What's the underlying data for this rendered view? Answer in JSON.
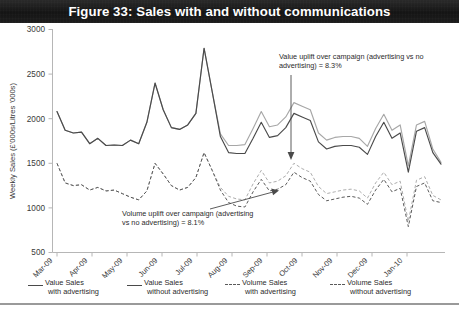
{
  "figure": {
    "title": "Figure 33: Sales with and without communications"
  },
  "axes": {
    "ylabel": "Weekly Sales (£'000s/Litres '000s)",
    "yticks": [
      "3000",
      "2500",
      "2000",
      "1500",
      "1000",
      "500"
    ],
    "xticks": [
      "Mar-09",
      "Apr-09",
      "May-09",
      "Jun-09",
      "Jul-09",
      "Aug-09",
      "Sep-09",
      "Oct-09",
      "Nov-09",
      "Dec-09",
      "Jan-10"
    ]
  },
  "annotations": [
    {
      "name": "value-uplift-annotation",
      "line1": "Value uplift over campaign (advertising vs no",
      "line2": "advertising) = 8.3%"
    },
    {
      "name": "volume-uplift-annotation",
      "line1": "Volume uplift over campaign (advertising",
      "line2": "vs no advertising) = 8.1%"
    }
  ],
  "legend": [
    {
      "line1": "Value Sales",
      "line2": "with advertising",
      "style": "solid-dark",
      "color": "#4a4a4a"
    },
    {
      "line1": "Value Sales",
      "line2": "without advertising",
      "style": "solid-light",
      "color": "#a7a7a7"
    },
    {
      "line1": "Volume Sales",
      "line2": "with advertising",
      "style": "dash-dark",
      "color": "#5a5a5a"
    },
    {
      "line1": "Volume Sales",
      "line2": "without advertising",
      "style": "dash-light",
      "color": "#adadad"
    }
  ],
  "chart_data": {
    "type": "line",
    "title": "Figure 33: Sales with and without communications",
    "xlabel": "",
    "ylabel": "Weekly Sales (£'000s/Litres '000s)",
    "ylim": [
      500,
      3000
    ],
    "ytick_step": 500,
    "grid": false,
    "legend_position": "bottom",
    "x_tick_labels": [
      "Mar-09",
      "Apr-09",
      "May-09",
      "Jun-09",
      "Jul-09",
      "Aug-09",
      "Sep-09",
      "Oct-09",
      "Nov-09",
      "Dec-09",
      "Jan-10"
    ],
    "x_weeks": 48,
    "note": "Weekly observations from Mar-09 to Jan-10. Paired 'with advertising' and 'without advertising' series coincide before the campaign and separate during/after it.",
    "series": [
      {
        "name": "Value Sales with advertising",
        "style": "solid",
        "color": "#4a4a4a",
        "values": [
          2080,
          1870,
          1840,
          1850,
          1720,
          1780,
          1700,
          1705,
          1700,
          1760,
          1720,
          1960,
          2400,
          2100,
          1900,
          1880,
          1930,
          2060,
          2790,
          2300,
          1800,
          1620,
          1610,
          1610,
          1780,
          1960,
          1790,
          1810,
          1900,
          2060,
          2020,
          1980,
          1740,
          1660,
          1690,
          1700,
          1700,
          1680,
          1600,
          1800,
          1960,
          1780,
          1840,
          1400,
          1860,
          1900,
          1620,
          1490
        ]
      },
      {
        "name": "Value Sales without advertising",
        "style": "solid",
        "color": "#a7a7a7",
        "values": [
          2080,
          1870,
          1840,
          1850,
          1720,
          1780,
          1700,
          1705,
          1700,
          1760,
          1720,
          1960,
          2400,
          2100,
          1900,
          1880,
          1930,
          2060,
          2790,
          2300,
          1830,
          1700,
          1700,
          1710,
          1890,
          2080,
          1910,
          1930,
          2020,
          2180,
          2140,
          2100,
          1840,
          1760,
          1790,
          1800,
          1800,
          1780,
          1690,
          1890,
          2050,
          1870,
          1930,
          1470,
          1930,
          1970,
          1660,
          1510
        ]
      },
      {
        "name": "Volume Sales with advertising",
        "style": "dashed",
        "color": "#5a5a5a",
        "values": [
          1500,
          1280,
          1250,
          1260,
          1200,
          1230,
          1190,
          1200,
          1160,
          1120,
          1090,
          1190,
          1500,
          1380,
          1250,
          1200,
          1230,
          1340,
          1620,
          1420,
          1200,
          1060,
          1020,
          1010,
          1180,
          1320,
          1190,
          1210,
          1260,
          1400,
          1340,
          1300,
          1150,
          1080,
          1100,
          1120,
          1130,
          1110,
          1040,
          1200,
          1320,
          1180,
          1220,
          790,
          1240,
          1280,
          1080,
          1060
        ]
      },
      {
        "name": "Volume Sales without advertising",
        "style": "dashed",
        "color": "#adadad",
        "values": [
          1500,
          1280,
          1250,
          1260,
          1200,
          1230,
          1190,
          1200,
          1160,
          1120,
          1090,
          1190,
          1500,
          1380,
          1250,
          1200,
          1230,
          1340,
          1620,
          1420,
          1230,
          1130,
          1100,
          1090,
          1270,
          1420,
          1280,
          1300,
          1360,
          1500,
          1440,
          1400,
          1240,
          1160,
          1180,
          1200,
          1210,
          1190,
          1110,
          1280,
          1400,
          1260,
          1300,
          850,
          1310,
          1350,
          1140,
          1090
        ]
      }
    ],
    "uplift_annotations": [
      {
        "label": "Value uplift over campaign (advertising vs no advertising)",
        "value": "8.3%"
      },
      {
        "label": "Volume uplift over campaign (advertising vs no advertising)",
        "value": "8.1%"
      }
    ]
  }
}
